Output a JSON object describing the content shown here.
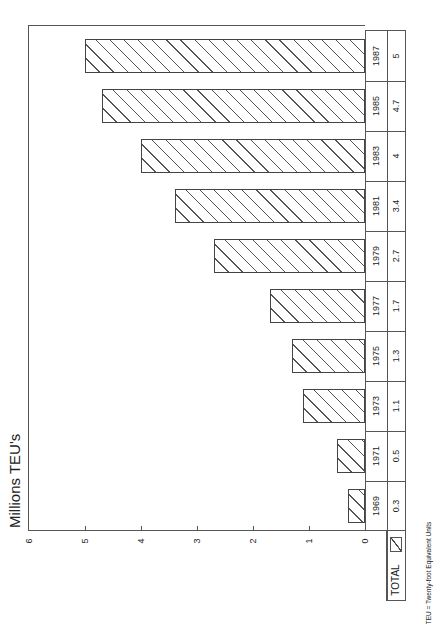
{
  "chart": {
    "title": "Millions TEU's",
    "footnote": "TEU = Twenty-foot Equivalent Units",
    "legend": {
      "label": "TOTAL",
      "pattern": "diagonal-hatch"
    },
    "axis": {
      "ticks": [
        "6",
        "5",
        "4",
        "3",
        "2",
        "1",
        "0"
      ]
    },
    "table": {
      "years": [
        "1969",
        "1971",
        "1973",
        "1975",
        "1977",
        "1979",
        "1981",
        "1983",
        "1985",
        "1987"
      ],
      "values": [
        "0.3",
        "0.5",
        "1.1",
        "1.3",
        "1.7",
        "2.7",
        "3.4",
        "4",
        "4.7",
        "5"
      ]
    }
  },
  "chart_data": {
    "type": "bar",
    "orientation": "vertical (image rotated 90° counter-clockwise)",
    "title": "Millions TEU's",
    "xlabel": "",
    "ylabel": "Millions TEU's",
    "categories": [
      "1969",
      "1971",
      "1973",
      "1975",
      "1977",
      "1979",
      "1981",
      "1983",
      "1985",
      "1987"
    ],
    "series": [
      {
        "name": "TOTAL",
        "values": [
          0.3,
          0.5,
          1.1,
          1.3,
          1.7,
          2.7,
          3.4,
          4.0,
          4.7,
          5.0
        ]
      }
    ],
    "ylim": [
      0,
      6
    ],
    "yticks": [
      0,
      1,
      2,
      3,
      4,
      5,
      6
    ],
    "grid": false,
    "legend_position": "bottom-left (data table)",
    "annotations": [
      "TEU = Twenty-foot Equivalent Units"
    ],
    "data_table": true
  }
}
